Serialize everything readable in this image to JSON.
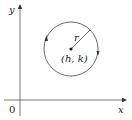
{
  "diagram": {
    "type": "circle-on-cartesian-plane",
    "axes": {
      "x_label": "x",
      "y_label": "y",
      "origin_label": "0"
    },
    "circle": {
      "center_label": "(h, k)",
      "radius_label": "r",
      "direction": "counterclockwise",
      "stroke_color": "#444444"
    }
  }
}
